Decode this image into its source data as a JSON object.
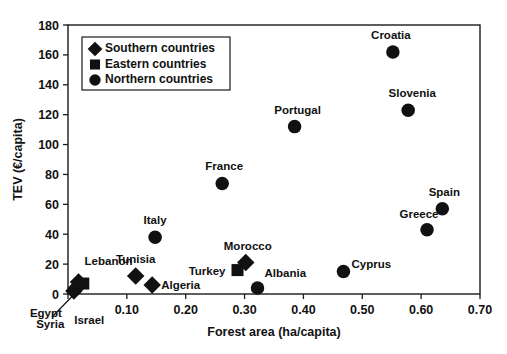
{
  "chart_data": {
    "type": "scatter",
    "title": "",
    "xlabel": "Forest area (ha/capita)",
    "ylabel": "TEV (€/capita)",
    "xlim": [
      0,
      0.7
    ],
    "ylim": [
      0,
      180
    ],
    "xticks": [
      "0.00",
      "0.10",
      "0.20",
      "0.30",
      "0.40",
      "0.50",
      "0.60",
      "0.70"
    ],
    "xtick_values": [
      0,
      0.1,
      0.2,
      0.3,
      0.4,
      0.5,
      0.6,
      0.7
    ],
    "xticklabels_shown": [
      "",
      "0.10",
      "0.20",
      "0.30",
      "0.40",
      "0.50",
      "0.60",
      "0.70"
    ],
    "yticks": [
      "0",
      "20",
      "40",
      "60",
      "80",
      "100",
      "120",
      "140",
      "160",
      "180"
    ],
    "ytick_values": [
      0,
      20,
      40,
      60,
      80,
      100,
      120,
      140,
      160,
      180
    ],
    "grid": false,
    "legend_position": "top-left-inside",
    "marker_color": "#111111",
    "series": [
      {
        "name": "Southern countries",
        "marker": "diamond",
        "points": [
          {
            "label": "Tunisia",
            "x": 0.115,
            "y": 12,
            "label_dx": 0,
            "label_dy": -13,
            "anchor": "middle"
          },
          {
            "label": "Algeria",
            "x": 0.143,
            "y": 6,
            "label_dx": 9,
            "label_dy": 4,
            "anchor": "start"
          },
          {
            "label": "Morocco",
            "x": 0.302,
            "y": 21,
            "label_dx": 2,
            "label_dy": -13,
            "anchor": "middle"
          },
          {
            "label": "Lebanon",
            "x": 0.018,
            "y": 8,
            "label_dx": 6,
            "label_dy": -17,
            "anchor": "start"
          },
          {
            "label": "Egypt",
            "x": 0.01,
            "y": 2,
            "label_dx": -28,
            "label_dy": 26,
            "anchor": "middle"
          },
          {
            "label": "Syria",
            "x": 0.014,
            "y": 4,
            "label_dx": -26,
            "label_dy": 40,
            "anchor": "middle"
          }
        ]
      },
      {
        "name": "Eastern countries",
        "marker": "square",
        "points": [
          {
            "label": "Turkey",
            "x": 0.288,
            "y": 16,
            "label_dx": -12,
            "label_dy": 5,
            "anchor": "end"
          },
          {
            "label": "Israel",
            "x": 0.026,
            "y": 7,
            "label_dx": 6,
            "label_dy": 40,
            "anchor": "middle"
          }
        ]
      },
      {
        "name": "Northern countries",
        "marker": "circle",
        "points": [
          {
            "label": "Italy",
            "x": 0.148,
            "y": 38,
            "label_dx": 0,
            "label_dy": -13,
            "anchor": "middle"
          },
          {
            "label": "France",
            "x": 0.262,
            "y": 74,
            "label_dx": 2,
            "label_dy": -13,
            "anchor": "middle"
          },
          {
            "label": "Portugal",
            "x": 0.385,
            "y": 112,
            "label_dx": 3,
            "label_dy": -13,
            "anchor": "middle"
          },
          {
            "label": "Croatia",
            "x": 0.552,
            "y": 162,
            "label_dx": -2,
            "label_dy": -13,
            "anchor": "middle"
          },
          {
            "label": "Slovenia",
            "x": 0.578,
            "y": 123,
            "label_dx": 4,
            "label_dy": -13,
            "anchor": "middle"
          },
          {
            "label": "Spain",
            "x": 0.636,
            "y": 57,
            "label_dx": 2,
            "label_dy": -13,
            "anchor": "middle"
          },
          {
            "label": "Greece",
            "x": 0.61,
            "y": 43,
            "label_dx": -8,
            "label_dy": -12,
            "anchor": "middle"
          },
          {
            "label": "Cyprus",
            "x": 0.468,
            "y": 15,
            "label_dx": 8,
            "label_dy": -4,
            "anchor": "start"
          },
          {
            "label": "Albania",
            "x": 0.322,
            "y": 4,
            "label_dx": 7,
            "label_dy": -11,
            "anchor": "start"
          }
        ]
      }
    ],
    "annotations": [
      {
        "name": "egypt-leader-line",
        "text": "",
        "from_x": 0.012,
        "from_y": 1,
        "to_label": "Egypt"
      }
    ]
  },
  "legend": {
    "items": [
      {
        "label": "Southern countries",
        "marker": "diamond"
      },
      {
        "label": "Eastern countries",
        "marker": "square"
      },
      {
        "label": "Northern countries",
        "marker": "circle"
      }
    ]
  }
}
